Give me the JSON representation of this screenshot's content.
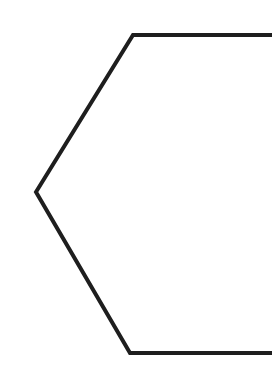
{
  "diagram": {
    "canvas": {
      "width": 272,
      "height": 390,
      "background": "#ffffff"
    },
    "shapes": [
      {
        "type": "hexagon",
        "cropped": "right",
        "stroke": "#1e1e1e",
        "stroke_width": 4,
        "fill": "none",
        "points": [
          [
            278,
            35
          ],
          [
            133,
            35
          ],
          [
            36,
            192
          ],
          [
            130,
            353
          ],
          [
            278,
            353
          ]
        ]
      }
    ]
  }
}
